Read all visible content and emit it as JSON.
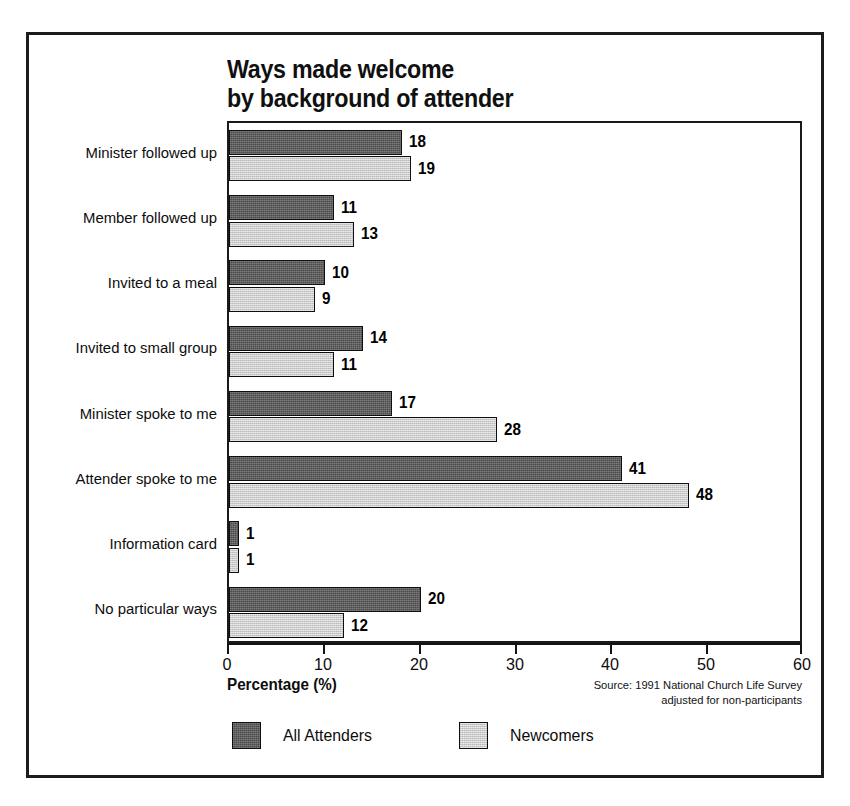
{
  "chart_data": {
    "type": "bar",
    "orientation": "horizontal",
    "title": "Ways made welcome\nby background of attender",
    "xlabel": "Percentage (%)",
    "ylabel": "",
    "xlim": [
      0,
      60
    ],
    "xticks": [
      0,
      10,
      20,
      30,
      40,
      50,
      60
    ],
    "grid": false,
    "legend_position": "bottom-left",
    "categories": [
      "Minister followed up",
      "Member followed up",
      "Invited to a meal",
      "Invited to small group",
      "Minister spoke to me",
      "Attender spoke to me",
      "Information card",
      "No particular ways"
    ],
    "series": [
      {
        "name": "All Attenders",
        "color": "#4a4a4a",
        "values": [
          18,
          11,
          10,
          14,
          17,
          41,
          1,
          20
        ]
      },
      {
        "name": "Newcomers",
        "color": "#cdcdcd",
        "values": [
          19,
          13,
          9,
          11,
          28,
          48,
          1,
          12
        ]
      }
    ],
    "annotations": [
      "NB: Since attenders  could select two responses\npercentages may not add to 100.",
      "Source: 1991 National Church Life Survey\nadjusted for non-participants"
    ],
    "note": "NB: Since attenders  could select two responses\npercentages may not add to 100.",
    "source": "Source: 1991 National Church Life Survey\nadjusted for non-participants"
  },
  "colors": {
    "all_attenders": "#4a4a4a",
    "newcomers": "#cdcdcd",
    "frame": "#1c1c1c",
    "axis": "#141414",
    "text": "#0d0d0d",
    "background": "#ffffff"
  }
}
